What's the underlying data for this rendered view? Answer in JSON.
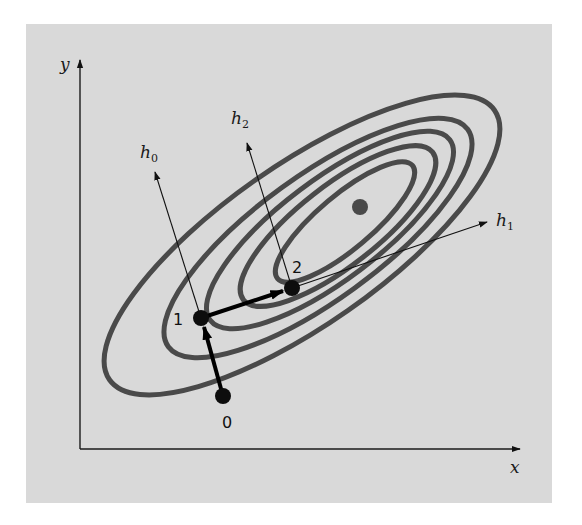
{
  "figure": {
    "axes": {
      "x_label": "x",
      "y_label": "y"
    },
    "directions": [
      {
        "name": "h",
        "subscript": "0"
      },
      {
        "name": "h",
        "subscript": "1"
      },
      {
        "name": "h",
        "subscript": "2"
      }
    ],
    "points": [
      {
        "label": "0"
      },
      {
        "label": "1"
      },
      {
        "label": "2"
      }
    ],
    "contour_count": 5,
    "colors": {
      "panel": "#d9d9d9",
      "contour": "#4a4a4a",
      "points": "#0d0d0d",
      "optimum": "#4a4a4a"
    }
  }
}
